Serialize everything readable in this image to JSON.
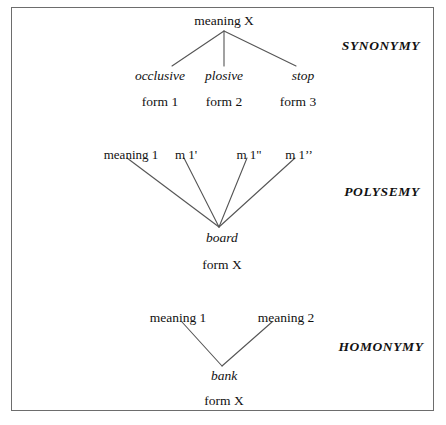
{
  "figure": {
    "border_color": "#6d6d6d",
    "line_color": "#555555",
    "text_color": "#111111",
    "background": "#ffffff"
  },
  "sections": [
    {
      "name": "SYNONYMY",
      "top_node": "meaning X",
      "middle_row": [
        "occlusive",
        "plosive",
        "stop"
      ],
      "bottom_row": [
        "form 1",
        "form 2",
        "form 3"
      ]
    },
    {
      "name": "POLYSEMY",
      "top_row": [
        "meaning 1",
        "m 1'",
        "m 1\"",
        "m 1’’"
      ],
      "vertex_word": "board",
      "bottom_label": "form X"
    },
    {
      "name": "HOMONYMY",
      "top_row": [
        "meaning 1",
        "meaning 2"
      ],
      "vertex_word": "bank",
      "bottom_label": "form X"
    }
  ]
}
